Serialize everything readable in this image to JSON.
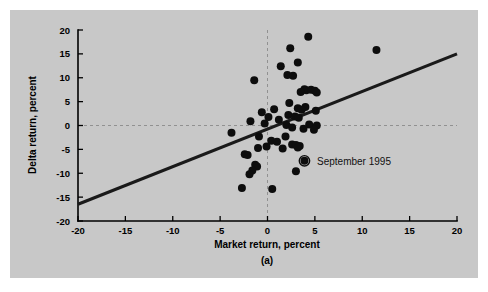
{
  "figure": {
    "caption": "(a)",
    "background_color": "#c8c8c8",
    "page_color": "#ffffff"
  },
  "annotation": {
    "label": "September 1995",
    "marker": "target-circle-icon",
    "x": 3.9,
    "y": -7.4
  },
  "chart_data": {
    "type": "scatter",
    "title": "",
    "subtitle": "",
    "caption": "(a)",
    "xlabel": "Market return, percent",
    "ylabel": "Delta return, percent",
    "xlim": [
      -20,
      20
    ],
    "ylim": [
      -20,
      20
    ],
    "xticks": [
      -20,
      -15,
      -10,
      -5,
      0,
      5,
      10,
      15,
      20
    ],
    "yticks": [
      -20,
      -15,
      -10,
      -5,
      0,
      5,
      10,
      15,
      20
    ],
    "xtick_labels": [
      "-20",
      "-15",
      "-10",
      "-5",
      "0",
      "5",
      "10",
      "15",
      "20"
    ],
    "ytick_labels": [
      "-20",
      "-15",
      "-10",
      "-5",
      "0",
      "5",
      "10",
      "15",
      "20"
    ],
    "grid": false,
    "zero_reference_line": {
      "axis": "y",
      "value": 0,
      "style": "dashed",
      "color": "#8a8a8a"
    },
    "legend": null,
    "marker_color": "#0d0d0d",
    "marker_size": 4.0,
    "fit_line": {
      "label": "regression line",
      "color": "#1a1a1a",
      "width": 3.1,
      "x_start": -20,
      "y_start": -16.5,
      "x_end": 20,
      "y_end": 15.0,
      "slope": 0.7875,
      "intercept": -0.75
    },
    "series": [
      {
        "name": "monthly returns",
        "points": [
          [
            11.5,
            15.8
          ],
          [
            4.3,
            18.6
          ],
          [
            2.4,
            16.2
          ],
          [
            3.2,
            13.2
          ],
          [
            1.4,
            12.4
          ],
          [
            2.1,
            10.6
          ],
          [
            2.7,
            10.4
          ],
          [
            -1.4,
            9.5
          ],
          [
            3.9,
            7.6
          ],
          [
            4.1,
            7.4
          ],
          [
            4.6,
            7.5
          ],
          [
            5.0,
            7.3
          ],
          [
            3.5,
            7.0
          ],
          [
            5.2,
            6.9
          ],
          [
            2.3,
            4.7
          ],
          [
            3.2,
            3.6
          ],
          [
            4.0,
            3.9
          ],
          [
            3.6,
            3.3
          ],
          [
            5.1,
            3.1
          ],
          [
            0.7,
            3.4
          ],
          [
            -0.6,
            2.8
          ],
          [
            2.2,
            2.2
          ],
          [
            2.9,
            1.9
          ],
          [
            3.3,
            1.6
          ],
          [
            0.1,
            1.8
          ],
          [
            1.2,
            1.2
          ],
          [
            -1.8,
            0.9
          ],
          [
            -0.3,
            0.4
          ],
          [
            2.0,
            0.1
          ],
          [
            4.4,
            0.2
          ],
          [
            5.2,
            0.0
          ],
          [
            2.6,
            -0.4
          ],
          [
            3.8,
            -0.7
          ],
          [
            4.9,
            -0.9
          ],
          [
            -3.8,
            -1.5
          ],
          [
            -0.9,
            -2.3
          ],
          [
            1.9,
            -2.3
          ],
          [
            0.4,
            -3.2
          ],
          [
            1.0,
            -3.4
          ],
          [
            2.6,
            -4.0
          ],
          [
            3.0,
            -4.1
          ],
          [
            3.4,
            -4.3
          ],
          [
            3.2,
            -4.6
          ],
          [
            -0.1,
            -4.4
          ],
          [
            -1.0,
            -4.7
          ],
          [
            1.6,
            -4.8
          ],
          [
            -2.4,
            -6.0
          ],
          [
            -2.1,
            -6.2
          ],
          [
            3.9,
            -7.4
          ],
          [
            -1.3,
            -8.2
          ],
          [
            -1.1,
            -8.6
          ],
          [
            -1.6,
            -9.4
          ],
          [
            -1.9,
            -10.2
          ],
          [
            3.0,
            -9.6
          ],
          [
            -2.7,
            -13.1
          ],
          [
            0.5,
            -13.3
          ]
        ]
      }
    ]
  }
}
